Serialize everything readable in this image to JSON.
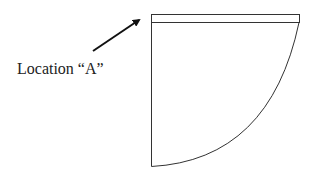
{
  "diagram": {
    "label": "Location “A”",
    "stroke_color": "#333333",
    "arrow_color": "#111111",
    "shape": "quarter-circle sector with top band",
    "arrow": {
      "from": [
        93,
        51
      ],
      "to": [
        140,
        19
      ]
    }
  }
}
